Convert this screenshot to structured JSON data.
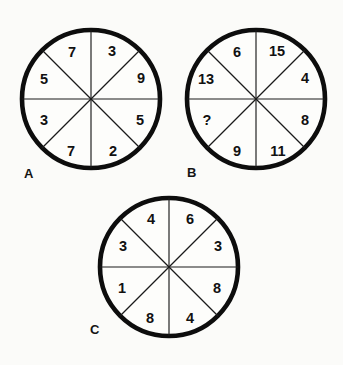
{
  "puzzle": {
    "type": "circle-sector-number-puzzle",
    "background_color": "#fbfbf9",
    "ink_color": "#0d0d0d",
    "sector_count_per_circle": 8,
    "unknown_marker": "?"
  },
  "circles": [
    {
      "id": "A",
      "label": "A",
      "label_x": 24,
      "label_y": 178,
      "center_x": 91,
      "center_y": 99,
      "radius": 69,
      "sectors": [
        {
          "position": "top-left-inner",
          "value": "7",
          "x": 72,
          "y": 52
        },
        {
          "position": "left-upper-outer",
          "value": "5",
          "x": 44,
          "y": 79
        },
        {
          "position": "left-lower-outer",
          "value": "3",
          "x": 44,
          "y": 120
        },
        {
          "position": "bottom-left-inner",
          "value": "7",
          "x": 71,
          "y": 151
        },
        {
          "position": "bottom-right-inner",
          "value": "2",
          "x": 113,
          "y": 151
        },
        {
          "position": "right-lower-outer",
          "value": "5",
          "x": 140,
          "y": 120
        },
        {
          "position": "right-upper-outer",
          "value": "9",
          "x": 141,
          "y": 78
        },
        {
          "position": "top-right-inner",
          "value": "3",
          "x": 112,
          "y": 51
        }
      ]
    },
    {
      "id": "B",
      "label": "B",
      "label_x": 187,
      "label_y": 177,
      "center_x": 256,
      "center_y": 99,
      "radius": 69,
      "sectors": [
        {
          "position": "top-left-inner",
          "value": "6",
          "x": 237,
          "y": 52
        },
        {
          "position": "left-upper-outer",
          "value": "13",
          "x": 206,
          "y": 79
        },
        {
          "position": "left-lower-outer",
          "value": "?",
          "x": 207,
          "y": 120
        },
        {
          "position": "bottom-left-inner",
          "value": "9",
          "x": 237,
          "y": 151
        },
        {
          "position": "bottom-right-inner",
          "value": "11",
          "x": 278,
          "y": 151
        },
        {
          "position": "right-lower-outer",
          "value": "8",
          "x": 305,
          "y": 120
        },
        {
          "position": "right-upper-outer",
          "value": "4",
          "x": 305,
          "y": 78
        },
        {
          "position": "top-right-inner",
          "value": "15",
          "x": 277,
          "y": 51
        }
      ]
    },
    {
      "id": "C",
      "label": "C",
      "label_x": 90,
      "label_y": 334,
      "center_x": 169,
      "center_y": 267,
      "radius": 69,
      "sectors": [
        {
          "position": "top-left-inner",
          "value": "4",
          "x": 151,
          "y": 219
        },
        {
          "position": "left-upper-outer",
          "value": "3",
          "x": 123,
          "y": 246
        },
        {
          "position": "left-lower-outer",
          "value": "1",
          "x": 122,
          "y": 288
        },
        {
          "position": "bottom-left-inner",
          "value": "8",
          "x": 150,
          "y": 318
        },
        {
          "position": "bottom-right-inner",
          "value": "4",
          "x": 190,
          "y": 318
        },
        {
          "position": "right-lower-outer",
          "value": "8",
          "x": 217,
          "y": 288
        },
        {
          "position": "right-upper-outer",
          "value": "3",
          "x": 218,
          "y": 246
        },
        {
          "position": "top-right-inner",
          "value": "6",
          "x": 190,
          "y": 219
        }
      ]
    }
  ]
}
